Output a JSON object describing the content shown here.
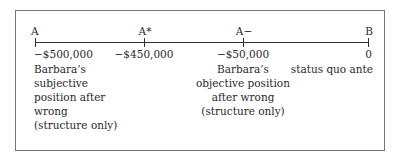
{
  "points": [
    {
      "label": "A",
      "value": "−$500,000",
      "x": 35
    },
    {
      "label": "A*",
      "value": "−$450,000",
      "x": 144
    },
    {
      "label": "A−",
      "value": "−$50,000",
      "x": 243
    },
    {
      "label": "B",
      "value": "0",
      "x": 369
    }
  ],
  "descriptions": {
    "a": [
      "Barbara’s",
      "subjective",
      "position after",
      "wrong",
      "(structure only)"
    ],
    "a_minus": [
      "Barbara’s",
      "objective position",
      "after wrong",
      "(structure only)"
    ],
    "b": [
      "status quo ante"
    ]
  }
}
